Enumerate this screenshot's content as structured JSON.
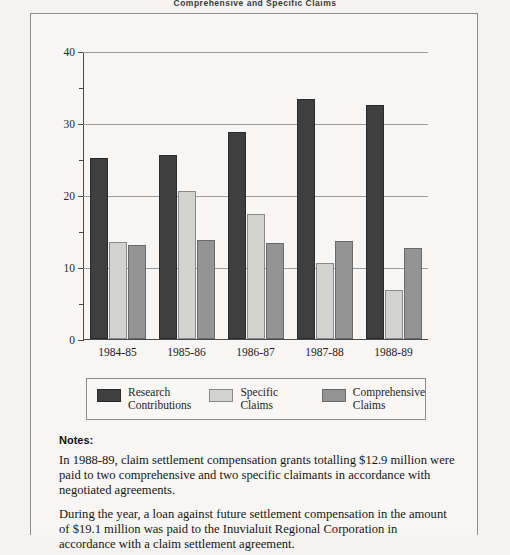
{
  "page": {
    "running_head": "Comprehensive and Specific Claims"
  },
  "chart_data": {
    "type": "bar",
    "title": "",
    "xlabel": "",
    "ylabel": "",
    "ylim": [
      0,
      40
    ],
    "yticks": [
      "0",
      "10",
      "20",
      "30",
      "40"
    ],
    "ytick_values": [
      0,
      10,
      20,
      30,
      40
    ],
    "yminor_values": [
      5,
      15,
      25,
      35
    ],
    "grid": true,
    "legend_position": "bottom",
    "categories": [
      "1984-85",
      "1985-86",
      "1986-87",
      "1987-88",
      "1988-89"
    ],
    "series": [
      {
        "name": "Research\nContributions",
        "color": "#3f3f3f",
        "values": [
          25.2,
          25.6,
          28.7,
          33.4,
          32.5
        ]
      },
      {
        "name": "Specific\nClaims",
        "color": "#d2d2d0",
        "values": [
          13.5,
          20.5,
          17.3,
          10.5,
          6.8
        ]
      },
      {
        "name": "Comprehensive\nClaims",
        "color": "#949494",
        "values": [
          13.0,
          13.7,
          13.4,
          13.6,
          12.7
        ]
      }
    ]
  },
  "notes": {
    "title": "Notes:",
    "paragraphs": [
      "In 1988-89, claim settlement compensation grants totalling $12.9 million were paid to two comprehensive and two specific claimants in accordance with negotiated agreements.",
      "During the year, a loan against future settlement compensation in the amount of $19.1 million was paid to the Inuvialuit Regional Corporation in accordance with a claim settlement agreement."
    ]
  },
  "colors": {
    "series_dark": "#3f3f3f",
    "series_light": "#d2d2d0",
    "series_medium": "#949494",
    "frame": "#8d8d8d",
    "page_background": "#f4f3f1"
  }
}
